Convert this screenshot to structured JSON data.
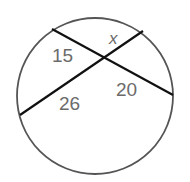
{
  "diagram": {
    "type": "intersecting-chords",
    "circle": {
      "cx": 95,
      "cy": 96,
      "r": 78,
      "stroke": "#555555"
    },
    "chords": [
      {
        "name": "chord-a",
        "x1": 52,
        "y1": 29,
        "x2": 173,
        "y2": 95
      },
      {
        "name": "chord-b",
        "x1": 20,
        "y1": 115,
        "x2": 143,
        "y2": 31
      }
    ],
    "labels": {
      "upper_left": "15",
      "upper_right": "x",
      "lower_right": "20",
      "lower_left": "26"
    }
  }
}
